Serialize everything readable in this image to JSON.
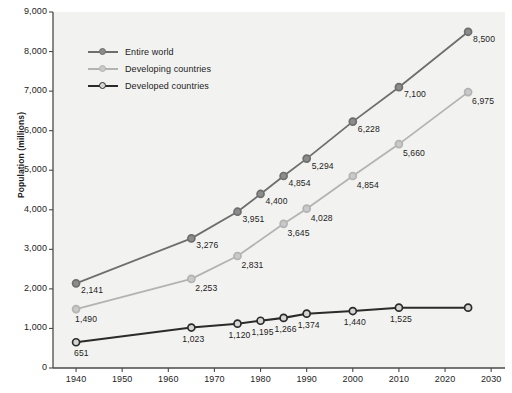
{
  "chart_data": {
    "type": "line",
    "title": "",
    "xlabel": "",
    "ylabel": "Population (millions)",
    "xlim": [
      1935,
      2033
    ],
    "ylim": [
      0,
      9000
    ],
    "grid": false,
    "legend_position": "top-left",
    "y_ticks": [
      "0",
      "1,000",
      "2,000",
      "3,000",
      "4,000",
      "5,000",
      "6,000",
      "7,000",
      "8,000",
      "9,000"
    ],
    "y_tick_values": [
      0,
      1000,
      2000,
      3000,
      4000,
      5000,
      6000,
      7000,
      8000,
      9000
    ],
    "x_ticks": [
      "1940",
      "1950",
      "1960",
      "1970",
      "1980",
      "1990",
      "2000",
      "2010",
      "2020",
      "2030"
    ],
    "x_tick_values": [
      1940,
      1950,
      1960,
      1970,
      1980,
      1990,
      2000,
      2010,
      2020,
      2030
    ],
    "series": [
      {
        "name": "Entire world",
        "color": "#6e6e6e",
        "marker_fill": "#8c8c8c",
        "x": [
          1940,
          1965,
          1975,
          1980,
          1985,
          1990,
          2000,
          2010,
          2025
        ],
        "values": [
          2141,
          3276,
          3951,
          4400,
          4854,
          5294,
          6228,
          7100,
          8500
        ],
        "labels": [
          "2,141",
          "3,276",
          "3,951",
          "4,400",
          "4,854",
          "5,294",
          "6,228",
          "7,100",
          "8,500"
        ]
      },
      {
        "name": "Developing countries",
        "color": "#b3b3b3",
        "marker_fill": "#c9c9c9",
        "x": [
          1940,
          1965,
          1975,
          1985,
          1990,
          2000,
          2010,
          2025
        ],
        "values": [
          1490,
          2253,
          2831,
          3645,
          4028,
          4854,
          5660,
          6975
        ],
        "labels": [
          "1,490",
          "2,253",
          "2,831",
          "3,645",
          "4,028",
          "4,854",
          "5,660",
          "6,975"
        ]
      },
      {
        "name": "Developed countries",
        "color": "#2b2b2b",
        "marker_fill": "#d6d6d6",
        "x": [
          1940,
          1965,
          1975,
          1980,
          1985,
          1990,
          2000,
          2010,
          2025
        ],
        "values": [
          651,
          1023,
          1120,
          1195,
          1266,
          1374,
          1440,
          1525,
          1525
        ],
        "labels": [
          "651",
          "1,023",
          "1,120",
          "1,195",
          "1,266",
          "1,374",
          "1,440",
          "1,525",
          ""
        ]
      }
    ],
    "plot_background": "#f2f2f0",
    "axis_color": "#4a4a4a"
  }
}
